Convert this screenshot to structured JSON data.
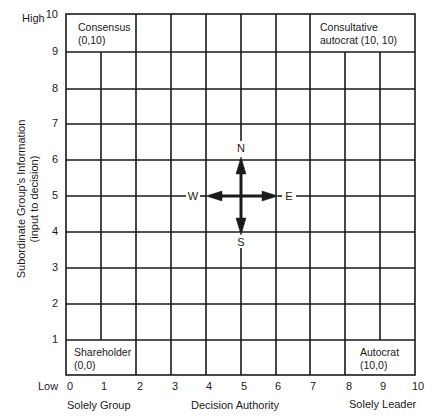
{
  "diagram": {
    "type": "grid-map",
    "y_axis": {
      "label_line1": "Subordinate Group's Information",
      "label_line2": "(input to decision)",
      "high_label": "High",
      "low_label": "Low",
      "ticks": [
        "10",
        "9",
        "8",
        "7",
        "6",
        "5",
        "4",
        "3",
        "2",
        "1"
      ]
    },
    "x_axis": {
      "label": "Decision Authority",
      "left_label": "Solely Group",
      "right_label": "Solely Leader",
      "ticks": [
        "0",
        "1",
        "2",
        "3",
        "4",
        "5",
        "6",
        "7",
        "8",
        "9",
        "10"
      ]
    },
    "corners": {
      "top_left": {
        "line1": "Consensus",
        "line2": "(0,10)"
      },
      "top_right": {
        "line1": "Consultative",
        "line2": "autocrat (10, 10)"
      },
      "bottom_left": {
        "line1": "Shareholder",
        "line2": "(0,0)"
      },
      "bottom_right": {
        "line1": "Autocrat",
        "line2": "(10,0)"
      }
    },
    "compass": {
      "north": "N",
      "south": "S",
      "east": "E",
      "west": "W",
      "center": [
        5,
        5
      ]
    },
    "colors": {
      "line": "#1a1a1a",
      "background": "#ffffff"
    }
  }
}
